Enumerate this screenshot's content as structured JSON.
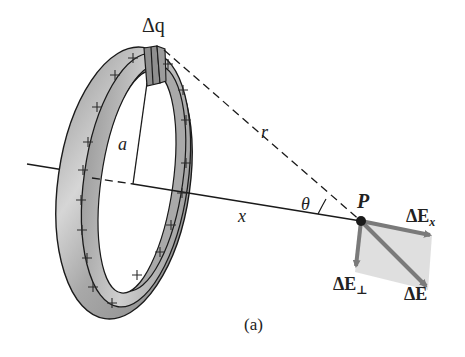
{
  "figure": {
    "caption": "(a)"
  },
  "labels": {
    "charge_element": "Δq",
    "radius": "a",
    "distance_r": "r",
    "axis_distance": "x",
    "angle": "θ",
    "point": "P",
    "field_x": "ΔE",
    "field_x_sub": "x",
    "field_perp": "ΔE",
    "field_perp_sub": "⊥",
    "field_total": "ΔE"
  },
  "ring": {
    "charge_sign": "+",
    "plus_count": 24,
    "color_fill": "#b8b8b8",
    "color_edge": "#1a1a1a"
  },
  "vectors": {
    "color": "#7a7a7a",
    "parallelogram_fill": "#d9d9d9"
  }
}
